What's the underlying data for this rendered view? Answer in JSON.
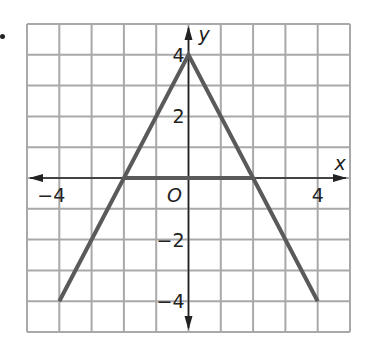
{
  "chart_data": {
    "type": "line",
    "title": "",
    "xlabel": "x",
    "ylabel": "y",
    "xlim": [
      -5,
      5
    ],
    "ylim": [
      -5,
      5
    ],
    "grid": true,
    "origin_label": "O",
    "x_tick_labels": [
      {
        "value": -4,
        "label": "−4"
      },
      {
        "value": 4,
        "label": "4"
      }
    ],
    "y_tick_labels": [
      {
        "value": 4,
        "label": "4"
      },
      {
        "value": 2,
        "label": "2"
      },
      {
        "value": -2,
        "label": "−2"
      },
      {
        "value": -4,
        "label": "−4"
      }
    ],
    "series": [
      {
        "name": "graph",
        "points": [
          [
            -4,
            -4
          ],
          [
            0,
            4
          ],
          [
            4,
            -4
          ]
        ]
      },
      {
        "name": "segment",
        "points": [
          [
            -2,
            0
          ],
          [
            2,
            0
          ]
        ]
      }
    ]
  },
  "colors": {
    "grid": "#a9a9a9",
    "axis": "#222222",
    "line": "#5a5a5a"
  }
}
